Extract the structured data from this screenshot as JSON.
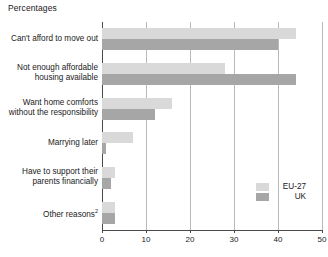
{
  "chart_data": {
    "type": "bar",
    "orientation": "horizontal",
    "title": "Percentages",
    "xlabel": "",
    "ylabel": "",
    "xlim": [
      0,
      50
    ],
    "xticks": [
      0,
      10,
      20,
      30,
      40,
      50
    ],
    "xtick_labels": [
      "0",
      "10",
      "20",
      "30",
      "40",
      "50"
    ],
    "grid": true,
    "grid_axis": "x",
    "legend_position": "right-lower",
    "categories": [
      "Can't afford to move out",
      "Not enough affordable housing available",
      "Want home comforts without the responsibility",
      "Marrying later",
      "Have to support their parents financially",
      "Other reasons"
    ],
    "category_lines": [
      [
        "Can't afford to move out"
      ],
      [
        "Not enough affordable",
        "housing available"
      ],
      [
        "Want home comforts",
        "without the responsibility"
      ],
      [
        "Marrying later"
      ],
      [
        "Have to support their",
        "parents financially"
      ],
      [
        "Other reasons"
      ]
    ],
    "category_footnotes": [
      "",
      "",
      "",
      "",
      "",
      "2"
    ],
    "series": [
      {
        "name": "EU-27",
        "color": "#d9d9d9",
        "values": [
          44,
          28,
          16,
          7,
          3,
          3
        ]
      },
      {
        "name": "UK",
        "color": "#a6a6a6",
        "values": [
          40,
          44,
          12,
          1,
          2,
          3
        ]
      }
    ]
  },
  "legend": {
    "items": [
      {
        "label": "EU-27",
        "color": "#d9d9d9"
      },
      {
        "label": "UK",
        "color": "#a6a6a6"
      }
    ]
  },
  "axis": {
    "ticks": [
      "0",
      "10",
      "20",
      "30",
      "40",
      "50"
    ]
  },
  "title": "Percentages"
}
